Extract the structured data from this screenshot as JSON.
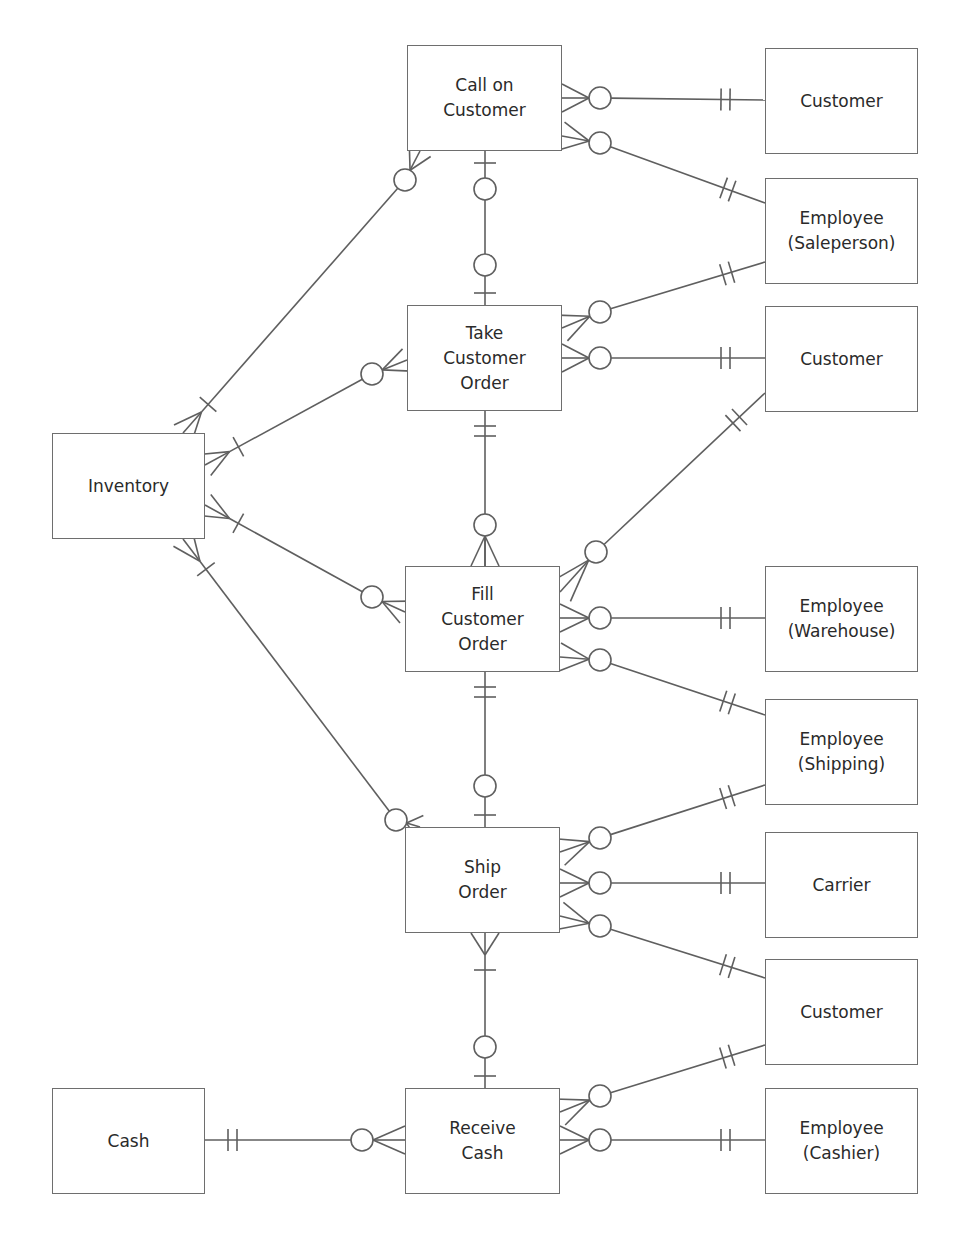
{
  "diagram": {
    "type": "ER / REA diagram (crow's foot notation)",
    "line_color": "#5f5f5f",
    "box_border_color": "#6e6e6e",
    "text_color": "#2a2a2a",
    "entities": [
      {
        "id": "call_on_customer",
        "label": "Call on\nCustomer",
        "x": 407,
        "y": 45,
        "w": 155,
        "h": 106
      },
      {
        "id": "take_customer_order",
        "label": "Take\nCustomer\nOrder",
        "x": 407,
        "y": 305,
        "w": 155,
        "h": 106
      },
      {
        "id": "fill_customer_order",
        "label": "Fill\nCustomer\nOrder",
        "x": 405,
        "y": 566,
        "w": 143,
        "h": 106
      },
      {
        "id": "ship_order",
        "label": "Ship\nOrder",
        "x": 405,
        "y": 827,
        "w": 143,
        "h": 106
      },
      {
        "id": "receive_cash",
        "label": "Receive\nCash",
        "x": 405,
        "y": 1088,
        "w": 83,
        "h": 106
      },
      {
        "id": "inventory",
        "label": "Inventory",
        "x": 52,
        "y": 433,
        "w": 153,
        "h": 106
      },
      {
        "id": "cash",
        "label": "Cash",
        "x": 52,
        "y": 1088,
        "w": 83,
        "h": 106
      },
      {
        "id": "customer_1",
        "label": "Customer",
        "x": 765,
        "y": 48,
        "w": 153,
        "h": 106
      },
      {
        "id": "employee_saleperson",
        "label": "Employee\n(Saleperson)",
        "x": 765,
        "y": 178,
        "w": 153,
        "h": 106
      },
      {
        "id": "customer_2",
        "label": "Customer",
        "x": 765,
        "y": 306,
        "w": 153,
        "h": 106
      },
      {
        "id": "employee_warehouse",
        "label": "Employee\n(Warehouse)",
        "x": 765,
        "y": 566,
        "w": 153,
        "h": 106
      },
      {
        "id": "employee_shipping",
        "label": "Employee\n(Shipping)",
        "x": 765,
        "y": 699,
        "w": 153,
        "h": 106
      },
      {
        "id": "carrier",
        "label": "Carrier",
        "x": 765,
        "y": 832,
        "w": 153,
        "h": 106
      },
      {
        "id": "customer_3",
        "label": "Customer",
        "x": 765,
        "y": 959,
        "w": 153,
        "h": 106
      },
      {
        "id": "employee_cashier",
        "label": "Employee\n(Cashier)",
        "x": 765,
        "y": 1088,
        "w": 153,
        "h": 106
      }
    ],
    "relationships": [
      {
        "from": "call_on_customer",
        "to": "customer_1",
        "from_end": "zero-or-many",
        "to_end": "one-and-only-one"
      },
      {
        "from": "call_on_customer",
        "to": "employee_saleperson",
        "from_end": "zero-or-many",
        "to_end": "one-and-only-one"
      },
      {
        "from": "call_on_customer",
        "to": "take_customer_order",
        "from_end": "one",
        "to_end": "zero-or-one"
      },
      {
        "from": "inventory",
        "to": "call_on_customer",
        "from_end": "many-one",
        "to_end": "zero-or-many"
      },
      {
        "from": "take_customer_order",
        "to": "employee_saleperson",
        "from_end": "zero-or-many",
        "to_end": "one-and-only-one"
      },
      {
        "from": "take_customer_order",
        "to": "customer_2",
        "from_end": "zero-or-many",
        "to_end": "one-and-only-one"
      },
      {
        "from": "inventory",
        "to": "take_customer_order",
        "from_end": "many-one",
        "to_end": "zero-or-many"
      },
      {
        "from": "take_customer_order",
        "to": "fill_customer_order",
        "from_end": "one-and-only-one",
        "to_end": "zero-or-many"
      },
      {
        "from": "fill_customer_order",
        "to": "customer_2",
        "from_end": "zero-or-many",
        "to_end": "one-and-only-one"
      },
      {
        "from": "fill_customer_order",
        "to": "employee_warehouse",
        "from_end": "zero-or-many",
        "to_end": "one-and-only-one"
      },
      {
        "from": "fill_customer_order",
        "to": "employee_shipping",
        "from_end": "zero-or-many",
        "to_end": "one-and-only-one"
      },
      {
        "from": "inventory",
        "to": "fill_customer_order",
        "from_end": "many-one",
        "to_end": "zero-or-many"
      },
      {
        "from": "fill_customer_order",
        "to": "ship_order",
        "from_end": "one-and-only-one",
        "to_end": "zero-or-one"
      },
      {
        "from": "inventory",
        "to": "ship_order",
        "from_end": "many-one",
        "to_end": "zero-or-many"
      },
      {
        "from": "ship_order",
        "to": "employee_shipping",
        "from_end": "zero-or-many",
        "to_end": "one-and-only-one"
      },
      {
        "from": "ship_order",
        "to": "carrier",
        "from_end": "zero-or-many",
        "to_end": "one-and-only-one"
      },
      {
        "from": "ship_order",
        "to": "customer_3",
        "from_end": "zero-or-many",
        "to_end": "one-and-only-one"
      },
      {
        "from": "ship_order",
        "to": "receive_cash",
        "from_end": "many-one",
        "to_end": "zero-or-one"
      },
      {
        "from": "receive_cash",
        "to": "customer_3",
        "from_end": "zero-or-many",
        "to_end": "one-and-only-one"
      },
      {
        "from": "receive_cash",
        "to": "employee_cashier",
        "from_end": "zero-or-many",
        "to_end": "one-and-only-one"
      },
      {
        "from": "receive_cash",
        "to": "cash",
        "from_end": "zero-or-many",
        "to_end": "one-and-only-one"
      }
    ]
  }
}
